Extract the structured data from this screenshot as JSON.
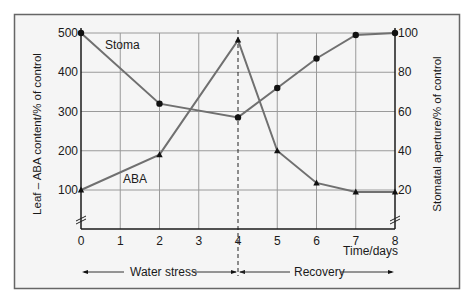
{
  "chart_data": {
    "type": "line",
    "title": "",
    "x": [
      0,
      1,
      2,
      3,
      4,
      5,
      6,
      7,
      8
    ],
    "xlabel": "Time/days",
    "ylabel": "Leaf – ABA content/% of control",
    "y2label": "Stomatal aperture/% of control",
    "xlim": [
      0,
      8
    ],
    "ylim": [
      0,
      500
    ],
    "y2lim": [
      0,
      100
    ],
    "xticks": [
      "0",
      "1",
      "2",
      "3",
      "4",
      "5",
      "6",
      "7",
      "8"
    ],
    "yticks": [
      "100",
      "200",
      "300",
      "400",
      "500"
    ],
    "y2ticks": [
      "20",
      "40",
      "60",
      "80",
      "100"
    ],
    "grid": true,
    "axis_breaks": [
      "left-axis-below-100",
      "right-axis-below-20"
    ],
    "series": [
      {
        "name": "Stoma",
        "axis": "right",
        "marker": "circle",
        "x": [
          0,
          2,
          4,
          5,
          6,
          7,
          8
        ],
        "values": [
          100,
          64,
          57,
          72,
          87,
          99,
          100
        ]
      },
      {
        "name": "ABA",
        "axis": "left",
        "marker": "triangle",
        "x": [
          0,
          2,
          4,
          5,
          6,
          7,
          8
        ],
        "values": [
          100,
          190,
          482,
          200,
          118,
          95,
          95
        ]
      }
    ],
    "annotations": [
      {
        "type": "vertical-dashed-line",
        "x": 4
      },
      {
        "type": "range-arrow",
        "label": "Water stress",
        "from": 0,
        "to": 4
      },
      {
        "type": "range-arrow",
        "label": "Recovery",
        "from": 4,
        "to": 8
      }
    ]
  },
  "labels": {
    "stoma": "Stoma",
    "aba": "ABA",
    "water_stress": "Water stress",
    "recovery": "Recovery",
    "x_title": "Time/days",
    "y_title": "Leaf – ABA content/% of control",
    "y2_title": "Stomatal aperture/% of control"
  },
  "colors": {
    "frame_bg": "#f5f5f5",
    "frame_border": "#666666",
    "grid": "#9a9a9a",
    "line": "#707070",
    "axis": "#1a1a1a",
    "marker": "#111111"
  }
}
